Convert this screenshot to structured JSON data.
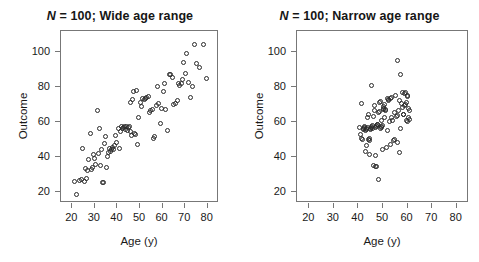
{
  "figure": {
    "background": "#ffffff",
    "point_color": "#2a2a2a",
    "axis_color": "#777777"
  },
  "chart_data": [
    {
      "type": "scatter",
      "panel": "left",
      "title": "N = 100; Wide age range",
      "title_prefix_italic": "N",
      "title_rest": " = 100; Wide age range",
      "xlabel": "Age (y)",
      "ylabel": "Outcome",
      "xlim": [
        15,
        85
      ],
      "ylim": [
        14,
        112
      ],
      "xticks": [
        20,
        30,
        40,
        50,
        60,
        70,
        80
      ],
      "xtick_labels": [
        "20",
        "30",
        "40",
        "50",
        "60",
        "70",
        "80"
      ],
      "yticks": [
        20,
        40,
        60,
        80,
        100
      ],
      "ytick_labels": [
        "20",
        "40",
        "60",
        "80",
        "100"
      ],
      "grid": false,
      "legend": "none",
      "n": 100,
      "x": [
        21.2,
        22.0,
        23.3,
        24.1,
        24.6,
        25.2,
        25.8,
        26.3,
        26.9,
        27.4,
        27.9,
        28.3,
        28.9,
        29.4,
        30.0,
        30.4,
        31.0,
        31.5,
        32.0,
        32.4,
        32.9,
        33.3,
        33.8,
        34.2,
        34.6,
        35.0,
        35.4,
        35.9,
        36.3,
        36.8,
        37.2,
        37.8,
        38.3,
        38.8,
        39.3,
        39.8,
        40.3,
        40.8,
        41.3,
        41.8,
        42.2,
        42.7,
        43.2,
        43.6,
        44.0,
        44.4,
        44.8,
        45.2,
        45.6,
        46.0,
        46.4,
        46.8,
        47.2,
        47.6,
        48.0,
        48.5,
        49.0,
        49.5,
        50.0,
        50.6,
        51.2,
        51.8,
        52.4,
        53.0,
        53.6,
        54.2,
        54.8,
        55.4,
        56.0,
        56.6,
        57.2,
        57.8,
        58.4,
        59.0,
        59.6,
        60.2,
        60.8,
        61.5,
        62.2,
        62.9,
        63.6,
        64.3,
        65.0,
        65.7,
        66.4,
        67.0,
        67.6,
        68.2,
        68.8,
        69.4,
        70.0,
        70.8,
        71.6,
        72.4,
        73.2,
        74.0,
        75.0,
        76.5,
        78.0,
        79.5
      ],
      "y": [
        26.5,
        19.0,
        27.0,
        27.5,
        44.8,
        26.5,
        33.5,
        28.0,
        32.5,
        39.0,
        53.8,
        33.0,
        34.0,
        41.5,
        39.5,
        36.0,
        66.5,
        42.0,
        56.5,
        35.5,
        44.5,
        25.5,
        25.5,
        48.0,
        52.0,
        34.5,
        40.5,
        42.5,
        45.0,
        43.5,
        44.5,
        45.5,
        44.5,
        46.5,
        52.5,
        48.5,
        56.5,
        45.0,
        55.0,
        57.5,
        56.5,
        57.0,
        57.5,
        56.0,
        57.5,
        55.5,
        57.0,
        57.5,
        71.0,
        55.0,
        52.5,
        73.0,
        77.5,
        53.5,
        53.0,
        78.0,
        47.5,
        62.5,
        71.5,
        69.0,
        73.5,
        73.0,
        73.5,
        74.0,
        74.5,
        65.5,
        66.5,
        67.0,
        51.0,
        52.0,
        69.5,
        80.5,
        70.5,
        59.5,
        68.0,
        77.5,
        82.0,
        67.0,
        55.5,
        87.5,
        87.0,
        85.5,
        70.0,
        70.5,
        72.5,
        82.0,
        81.0,
        82.0,
        84.5,
        94.0,
        88.0,
        99.0,
        82.5,
        74.0,
        80.5,
        104.5,
        93.5,
        91.0,
        104.5,
        85.0
      ]
    },
    {
      "type": "scatter",
      "panel": "right",
      "title": "N = 100; Narrow age range",
      "title_prefix_italic": "N",
      "title_rest": " = 100; Narrow age range",
      "xlabel": "Age (y)",
      "ylabel": "Outcome",
      "xlim": [
        15,
        85
      ],
      "ylim": [
        14,
        112
      ],
      "xticks": [
        20,
        30,
        40,
        50,
        60,
        70,
        80
      ],
      "xtick_labels": [
        "20",
        "30",
        "40",
        "50",
        "60",
        "70",
        "80"
      ],
      "yticks": [
        20,
        40,
        60,
        80,
        100
      ],
      "ytick_labels": [
        "20",
        "40",
        "60",
        "80",
        "100"
      ],
      "grid": false,
      "legend": "none",
      "n": 100,
      "x": [
        40.4,
        40.8,
        41.1,
        41.4,
        41.7,
        42.0,
        42.2,
        42.4,
        42.6,
        42.8,
        43.0,
        43.2,
        43.4,
        43.6,
        43.8,
        44.0,
        44.2,
        44.4,
        44.6,
        44.8,
        45.0,
        45.2,
        45.4,
        45.6,
        45.8,
        46.0,
        46.2,
        46.4,
        46.6,
        46.8,
        47.0,
        47.2,
        47.4,
        47.6,
        47.8,
        48.0,
        48.2,
        48.4,
        48.6,
        48.8,
        49.0,
        49.2,
        49.4,
        49.6,
        49.8,
        50.0,
        50.2,
        50.4,
        50.6,
        50.8,
        51.0,
        51.2,
        51.5,
        51.8,
        52.1,
        52.4,
        52.7,
        53.0,
        53.3,
        53.6,
        53.9,
        54.2,
        54.5,
        54.8,
        55.1,
        55.4,
        55.7,
        56.0,
        56.3,
        56.6,
        56.9,
        57.2,
        57.5,
        57.8,
        58.1,
        58.4,
        58.6,
        58.8,
        59.0,
        59.2,
        59.4,
        59.6,
        59.8,
        60.0,
        60.2,
        60.4,
        60.6,
        60.8,
        44.6,
        46.9,
        47.5,
        43.2,
        45.4,
        55.9,
        57.2,
        49.5,
        51.8,
        53.2,
        58.5,
        59.9
      ],
      "y": [
        57.0,
        53.0,
        70.5,
        50.5,
        50.0,
        56.5,
        56.0,
        57.0,
        57.5,
        43.5,
        55.5,
        56.0,
        56.5,
        57.0,
        62.5,
        64.5,
        50.0,
        49.5,
        50.5,
        56.0,
        56.5,
        57.0,
        57.5,
        58.0,
        56.5,
        35.5,
        63.5,
        69.5,
        66.5,
        34.8,
        57.0,
        57.5,
        58.0,
        58.5,
        59.0,
        27.5,
        65.5,
        66.0,
        71.5,
        72.0,
        56.5,
        57.0,
        57.5,
        58.0,
        44.5,
        67.5,
        68.0,
        69.0,
        70.0,
        62.5,
        66.5,
        67.0,
        45.5,
        55.5,
        72.5,
        73.0,
        60.5,
        73.5,
        62.5,
        74.0,
        61.0,
        49.5,
        65.5,
        50.0,
        75.0,
        63.5,
        64.0,
        48.5,
        66.5,
        43.0,
        72.5,
        56.5,
        70.5,
        77.0,
        68.5,
        64.5,
        69.5,
        76.5,
        77.0,
        70.0,
        61.0,
        71.0,
        75.5,
        60.5,
        62.5,
        68.0,
        66.5,
        61.5,
        41.5,
        41.0,
        35.0,
        46.5,
        81.0,
        95.0,
        87.5,
        61.0,
        73.5,
        47.5,
        64.5,
        74.5
      ]
    }
  ]
}
